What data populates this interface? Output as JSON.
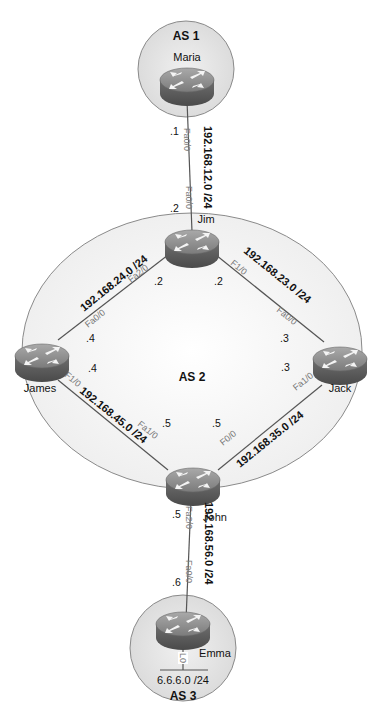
{
  "colors": {
    "as_area_fill": "#e6e6e6",
    "as2_area_fill": "#f7f7f7",
    "as_border": "#8a8a8a",
    "link": "#555555",
    "router_top": "#8c8c8c",
    "router_side": "#5e5e5e"
  },
  "autonomous_systems": [
    {
      "id": "as1",
      "label": "AS 1",
      "routers": [
        "Maria"
      ]
    },
    {
      "id": "as2",
      "label": "AS 2",
      "routers": [
        "Jim",
        "James",
        "Jack",
        "John"
      ]
    },
    {
      "id": "as3",
      "label": "AS 3",
      "routers": [
        "Emma"
      ]
    }
  ],
  "routers": {
    "maria": {
      "name": "Maria",
      "icon": "router-icon"
    },
    "jim": {
      "name": "Jim",
      "icon": "router-icon"
    },
    "james": {
      "name": "James",
      "icon": "router-icon"
    },
    "jack": {
      "name": "Jack",
      "icon": "router-icon"
    },
    "john": {
      "name": "John",
      "icon": "router-icon"
    },
    "emma": {
      "name": "Emma",
      "icon": "router-icon"
    }
  },
  "links": {
    "maria_jim": {
      "network": "192.168.12.0 /24",
      "a_intf": "Fa0/0",
      "a_ip": ".1",
      "b_intf": "Fa0/0",
      "b_ip": ".2"
    },
    "jim_james": {
      "network": "192.168.24.0 /24",
      "a_intf": "Fa2/0",
      "a_ip": ".2",
      "b_intf": "Fa0/0",
      "b_ip": ".4"
    },
    "jim_jack": {
      "network": "192.168.23.0 /24",
      "a_intf": "F1/0",
      "a_ip": ".2",
      "b_intf": "Fa0/0",
      "b_ip": ".3"
    },
    "james_john": {
      "network": "192.168.45.0 /24",
      "a_intf": "F1/0",
      "a_ip": ".4",
      "b_intf": "Fa1/0",
      "b_ip": ".5"
    },
    "jack_john": {
      "network": "192.168.35.0 /24",
      "a_intf": "Fa1/0",
      "a_ip": ".3",
      "b_intf": "F0/0",
      "b_ip": ".5"
    },
    "john_emma": {
      "network": "192.168.56.0 /24",
      "a_intf": "Fa2/0",
      "a_ip": ".5",
      "b_intf": "Fa0/0",
      "b_ip": ".6"
    }
  },
  "loopback": {
    "intf": "L0",
    "network": "6.6.6.0 /24"
  }
}
